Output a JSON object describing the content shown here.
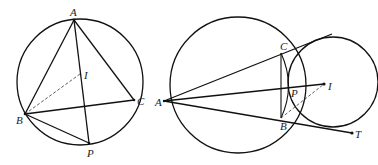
{
  "figures": [
    {
      "id": "left",
      "labels": {
        "A": "A",
        "B": "B",
        "C": "C",
        "I": "I",
        "P": "P"
      }
    },
    {
      "id": "right",
      "labels": {
        "A": "A",
        "B": "B",
        "C": "C",
        "I": "I",
        "P": "P",
        "T": "T"
      }
    }
  ],
  "colors": {
    "stroke": "#111111",
    "background": "#ffffff"
  }
}
